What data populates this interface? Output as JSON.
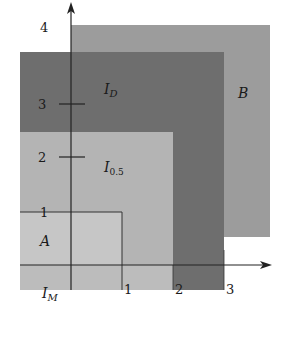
{
  "diagram": {
    "regions": [
      {
        "id": "B",
        "label": "B",
        "color": "#9c9c9c"
      },
      {
        "id": "ID",
        "label": "I",
        "subscript": "D",
        "color": "#6e6e6e"
      },
      {
        "id": "I05",
        "label": "I",
        "subscript": "0.5",
        "color": "#b4b4b4"
      },
      {
        "id": "A",
        "label": "A",
        "color": "#c6c6c6"
      },
      {
        "id": "IM",
        "label": "I",
        "subscript": "M",
        "color": "#bcbcbc"
      }
    ],
    "x_axis": {
      "ticks": [
        "1",
        "2",
        "3"
      ]
    },
    "y_axis": {
      "ticks": [
        "1",
        "2",
        "3",
        "4"
      ]
    },
    "axis_color": "#222222"
  }
}
